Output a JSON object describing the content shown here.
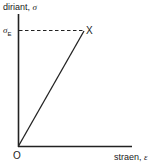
{
  "diagram": {
    "y_axis_label": "diriant,",
    "y_axis_symbol": "σ",
    "x_axis_label": "straen,",
    "x_axis_symbol": "ε",
    "origin_label": "O",
    "point_label": "X",
    "level_symbol": "σ",
    "level_subscript": "E",
    "colors": {
      "line": "#222222",
      "background": "#ffffff"
    }
  }
}
